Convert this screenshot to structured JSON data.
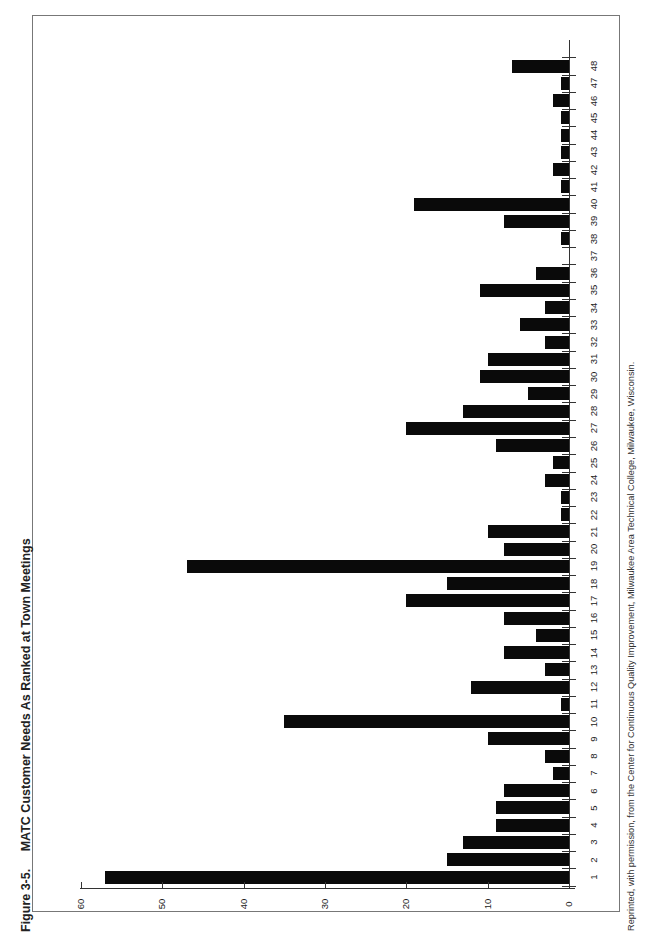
{
  "figure": {
    "title_number": "Figure 3-5.",
    "title_text": "MATC Customer Needs As Ranked at Town Meetings",
    "footer": "Reprinted, with permission, from the Center for Continuous Quality Improvement, Milwaukee Area Technical College, Milwaukee, Wisconsin."
  },
  "chart_data": {
    "type": "bar",
    "orientation": "horizontal bars (page rotated 90° counter-clockwise; reads as vertical column chart when page is turned)",
    "title": "MATC Customer Needs As Ranked at Town Meetings",
    "xlabel": "",
    "ylabel": "",
    "categories": [
      "1",
      "2",
      "3",
      "4",
      "5",
      "6",
      "7",
      "8",
      "9",
      "10",
      "11",
      "12",
      "13",
      "14",
      "15",
      "16",
      "17",
      "18",
      "19",
      "20",
      "21",
      "22",
      "23",
      "24",
      "25",
      "26",
      "27",
      "28",
      "29",
      "30",
      "31",
      "32",
      "33",
      "34",
      "35",
      "36",
      "37",
      "38",
      "39",
      "40",
      "41",
      "42",
      "43",
      "44",
      "45",
      "46",
      "47",
      "48"
    ],
    "values": [
      57,
      15,
      13,
      9,
      9,
      8,
      2,
      3,
      10,
      35,
      1,
      12,
      3,
      8,
      4,
      8,
      20,
      15,
      47,
      8,
      10,
      1,
      1,
      3,
      2,
      9,
      20,
      13,
      5,
      11,
      10,
      3,
      6,
      3,
      11,
      4,
      0,
      1,
      8,
      19,
      1,
      2,
      1,
      1,
      1,
      2,
      1,
      7
    ],
    "value_ticks": [
      "0",
      "10",
      "20",
      "30",
      "40",
      "50",
      "60"
    ],
    "ylim": [
      0,
      60
    ],
    "grid": false,
    "legend": null,
    "bar_color": "#0a0a0a"
  }
}
